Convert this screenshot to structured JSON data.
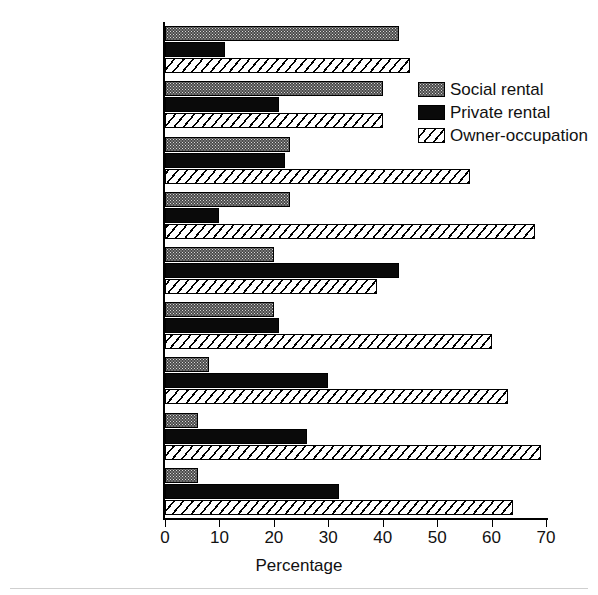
{
  "chart_data": {
    "type": "bar",
    "orientation": "horizontal",
    "title": "",
    "xlabel": "Percentage",
    "ylabel": "",
    "xlim": [
      0,
      70
    ],
    "xticks": [
      0,
      10,
      20,
      30,
      40,
      50,
      60,
      70
    ],
    "grid": false,
    "legend_position": "upper right",
    "categories": [
      "Netherlands",
      "Sweden",
      "France",
      "United Kingdom",
      "Germany",
      "Denmark",
      "Canada",
      "Australia",
      "United States"
    ],
    "series": [
      {
        "name": "Social rental",
        "fill": "stipple-gray",
        "values": [
          43,
          40,
          23,
          23,
          20,
          20,
          8,
          6,
          6
        ]
      },
      {
        "name": "Private rental",
        "fill": "solid-black",
        "values": [
          11,
          21,
          22,
          10,
          43,
          21,
          30,
          26,
          32
        ]
      },
      {
        "name": "Owner-occupation",
        "fill": "diagonal-hatch",
        "values": [
          45,
          40,
          56,
          68,
          39,
          60,
          63,
          69,
          64
        ]
      }
    ]
  },
  "axis": {
    "x_title": "Percentage",
    "tick_labels": [
      "0",
      "10",
      "20",
      "30",
      "40",
      "50",
      "60",
      "70"
    ]
  },
  "legend": {
    "items": [
      {
        "label": "Social rental"
      },
      {
        "label": "Private rental"
      },
      {
        "label": "Owner-occupation"
      }
    ]
  },
  "colors": {
    "axis": "#000000",
    "text": "#111111",
    "social_rental": "#4a4a4a",
    "private_rental": "#0a0a0a",
    "owner_occupation": "#ffffff",
    "background": "#ffffff"
  }
}
